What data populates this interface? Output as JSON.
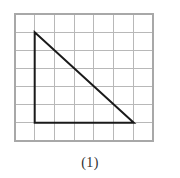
{
  "figure": {
    "caption": "(1)",
    "shape_name": "right triangle",
    "colors": {
      "background": "#ffffff",
      "grid_line": "#b8b8b8",
      "grid_border": "#a8a8a8",
      "shape_stroke": "#1a1a1a",
      "caption_text": "#303030"
    },
    "grid": {
      "columns": 7,
      "rows": 7,
      "x_start": 15,
      "y_start": 14,
      "cell_width": 19.7,
      "cell_height": 18.15,
      "line_width": 1,
      "border_width": 1.2
    },
    "shape": {
      "type": "polygon",
      "stroke_width": 2,
      "fill": "none",
      "vertices": [
        {
          "name": "apex",
          "x": 34.7,
          "y": 32.2,
          "grid_col": 1,
          "grid_row": 1
        },
        {
          "name": "bottom-left",
          "x": 34.7,
          "y": 122.7,
          "grid_col": 1,
          "grid_row": 6
        },
        {
          "name": "bottom-right",
          "x": 133.8,
          "y": 122.7,
          "grid_col": 6,
          "grid_row": 6
        }
      ],
      "legs": {
        "vertical_cells": 5,
        "horizontal_cells": 5
      }
    }
  }
}
